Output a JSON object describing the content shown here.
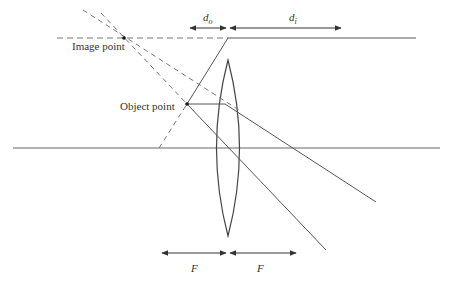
{
  "diagram": {
    "type": "converging-lens-ray-diagram",
    "labels": {
      "image_point": "Image point",
      "object_point": "Object point",
      "d_o": "d",
      "d_o_sub": "o",
      "d_i": "d",
      "d_i_sub": "i",
      "focal_left": "F",
      "focal_right": "F"
    },
    "colors": {
      "line": "#555555",
      "dashed": "#777777",
      "text": "#333333"
    },
    "geometry": {
      "optical_axis_y": 148,
      "lens_center_x": 228,
      "lens_top_y": 60,
      "lens_bottom_y": 236,
      "object_point": [
        187,
        104
      ],
      "image_point": [
        124,
        38
      ],
      "top_line_y": 38
    }
  }
}
